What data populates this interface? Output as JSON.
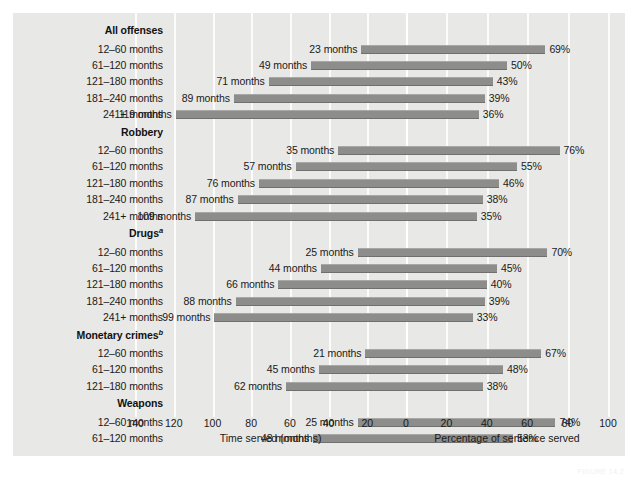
{
  "chart_data": {
    "type": "bar",
    "title": "",
    "subtitle": "",
    "orientation": "horizontal-bidirectional",
    "grid": true,
    "legend": null,
    "left_axis": {
      "label": "Time served (months)",
      "ticks": [
        140,
        120,
        100,
        80,
        60,
        40,
        20,
        0
      ],
      "tick_labels": [
        "140",
        "120",
        "100",
        "80",
        "60",
        "40",
        "20",
        "0"
      ],
      "range": [
        0,
        140
      ],
      "direction": "right-to-left"
    },
    "right_axis": {
      "label": "Percentage of sentence served",
      "ticks": [
        0,
        20,
        40,
        60,
        80,
        100
      ],
      "tick_labels": [
        "0",
        "20",
        "40",
        "60",
        "80",
        "100"
      ],
      "range": [
        0,
        100
      ],
      "direction": "left-to-right"
    },
    "series": [
      {
        "name": "Time served (months)",
        "axis": "left",
        "unit": "months"
      },
      {
        "name": "Percentage of sentence served",
        "axis": "right",
        "unit": "%"
      }
    ],
    "groups": [
      {
        "name": "All offenses",
        "footnote": "",
        "rows": [
          {
            "category": "12–60 months",
            "months": 23,
            "months_label": "23 months",
            "percent": 69,
            "percent_label": "69%"
          },
          {
            "category": "61–120 months",
            "months": 49,
            "months_label": "49 months",
            "percent": 50,
            "percent_label": "50%"
          },
          {
            "category": "121–180 months",
            "months": 71,
            "months_label": "71 months",
            "percent": 43,
            "percent_label": "43%"
          },
          {
            "category": "181–240 months",
            "months": 89,
            "months_label": "89 months",
            "percent": 39,
            "percent_label": "39%"
          },
          {
            "category": "241+ months",
            "months": 119,
            "months_label": "119 months",
            "percent": 36,
            "percent_label": "36%"
          }
        ]
      },
      {
        "name": "Robbery",
        "footnote": "",
        "rows": [
          {
            "category": "12–60 months",
            "months": 35,
            "months_label": "35 months",
            "percent": 76,
            "percent_label": "76%"
          },
          {
            "category": "61–120 months",
            "months": 57,
            "months_label": "57 months",
            "percent": 55,
            "percent_label": "55%"
          },
          {
            "category": "121–180 months",
            "months": 76,
            "months_label": "76 months",
            "percent": 46,
            "percent_label": "46%"
          },
          {
            "category": "181–240 months",
            "months": 87,
            "months_label": "87 months",
            "percent": 38,
            "percent_label": "38%"
          },
          {
            "category": "241+ months",
            "months": 109,
            "months_label": "109 months",
            "percent": 35,
            "percent_label": "35%"
          }
        ]
      },
      {
        "name": "Drugs",
        "footnote": "a",
        "rows": [
          {
            "category": "12–60 months",
            "months": 25,
            "months_label": "25 months",
            "percent": 70,
            "percent_label": "70%"
          },
          {
            "category": "61–120 months",
            "months": 44,
            "months_label": "44 months",
            "percent": 45,
            "percent_label": "45%"
          },
          {
            "category": "121–180 months",
            "months": 66,
            "months_label": "66 months",
            "percent": 40,
            "percent_label": "40%"
          },
          {
            "category": "181–240 months",
            "months": 88,
            "months_label": "88 months",
            "percent": 39,
            "percent_label": "39%"
          },
          {
            "category": "241+ months",
            "months": 99,
            "months_label": "99 months",
            "percent": 33,
            "percent_label": "33%"
          }
        ]
      },
      {
        "name": "Monetary crimes",
        "footnote": "b",
        "rows": [
          {
            "category": "12–60 months",
            "months": 21,
            "months_label": "21 months",
            "percent": 67,
            "percent_label": "67%"
          },
          {
            "category": "61–120 months",
            "months": 45,
            "months_label": "45 months",
            "percent": 48,
            "percent_label": "48%"
          },
          {
            "category": "121–180 months",
            "months": 62,
            "months_label": "62 months",
            "percent": 38,
            "percent_label": "38%"
          }
        ]
      },
      {
        "name": "Weapons",
        "footnote": "",
        "rows": [
          {
            "category": "12–60 months",
            "months": 25,
            "months_label": "25 months",
            "percent": 74,
            "percent_label": "74%"
          },
          {
            "category": "61–120 months",
            "months": 48,
            "months_label": "48 months",
            "percent": 53,
            "percent_label": "53%"
          }
        ]
      }
    ]
  },
  "figure": {
    "credit": "FIGURE 14.2"
  },
  "colors": {
    "panel_background": "#e8e8e6",
    "bar_fill": "#8d8d8b",
    "gridline": "#fcfcfb",
    "text": "#1a1a1a"
  }
}
